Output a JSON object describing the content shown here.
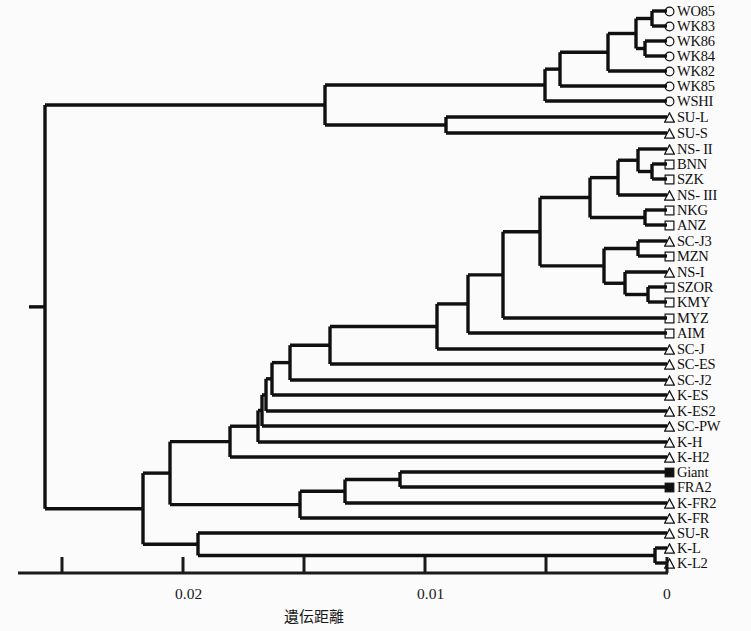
{
  "figure": {
    "type": "dendrogram",
    "axis": {
      "title": "遺伝距離",
      "ticks": [
        {
          "label": "",
          "value": 0.025,
          "x": 62
        },
        {
          "label": "0.02",
          "value": 0.02,
          "x": 183
        },
        {
          "label": "",
          "value": 0.015,
          "x": 304
        },
        {
          "label": "0.01",
          "value": 0.01,
          "x": 425
        },
        {
          "label": "",
          "value": 0.005,
          "x": 546
        },
        {
          "label": "0",
          "value": 0,
          "x": 667
        }
      ],
      "direction": "right-to-left",
      "min": 0,
      "max": 0.025
    },
    "colors": {
      "line": "#101010",
      "background": "#fbfbfb",
      "text": "#101010"
    },
    "marker_legend": {
      "circle": "open-circle",
      "triangle": "open-triangle",
      "square": "open-square",
      "filled_square": "filled-square"
    },
    "tips": [
      {
        "label": "WO85",
        "marker": "circle",
        "y": 11
      },
      {
        "label": "WK83",
        "marker": "circle",
        "y": 26
      },
      {
        "label": "WK86",
        "marker": "circle",
        "y": 41
      },
      {
        "label": "WK84",
        "marker": "circle",
        "y": 56
      },
      {
        "label": "WK82",
        "marker": "circle",
        "y": 71
      },
      {
        "label": "WK85",
        "marker": "circle",
        "y": 86
      },
      {
        "label": "WSHI",
        "marker": "circle",
        "y": 101
      },
      {
        "label": "SU-L",
        "marker": "triangle",
        "y": 117
      },
      {
        "label": "SU-S",
        "marker": "triangle",
        "y": 133
      },
      {
        "label": "NS- II",
        "marker": "triangle",
        "y": 149
      },
      {
        "label": "BNN",
        "marker": "square",
        "y": 164
      },
      {
        "label": "SZK",
        "marker": "square",
        "y": 179
      },
      {
        "label": "NS- III",
        "marker": "triangle",
        "y": 195
      },
      {
        "label": "NKG",
        "marker": "square",
        "y": 210
      },
      {
        "label": "ANZ",
        "marker": "square",
        "y": 225
      },
      {
        "label": "SC-J3",
        "marker": "triangle",
        "y": 241
      },
      {
        "label": "MZN",
        "marker": "square",
        "y": 256
      },
      {
        "label": "NS-I",
        "marker": "triangle",
        "y": 272
      },
      {
        "label": "SZOR",
        "marker": "square",
        "y": 287
      },
      {
        "label": "KMY",
        "marker": "square",
        "y": 302
      },
      {
        "label": "MYZ",
        "marker": "square",
        "y": 318
      },
      {
        "label": "AIM",
        "marker": "square",
        "y": 333
      },
      {
        "label": "SC-J",
        "marker": "triangle",
        "y": 349
      },
      {
        "label": "SC-ES",
        "marker": "triangle",
        "y": 364
      },
      {
        "label": "SC-J2",
        "marker": "triangle",
        "y": 380
      },
      {
        "label": "K-ES",
        "marker": "triangle",
        "y": 395
      },
      {
        "label": "K-ES2",
        "marker": "triangle",
        "y": 411
      },
      {
        "label": "SC-PW",
        "marker": "triangle",
        "y": 426
      },
      {
        "label": "K-H",
        "marker": "triangle",
        "y": 442
      },
      {
        "label": "K-H2",
        "marker": "triangle",
        "y": 457
      },
      {
        "label": "Giant",
        "marker": "filled_square",
        "y": 472
      },
      {
        "label": "FRA2",
        "marker": "filled_square",
        "y": 487
      },
      {
        "label": "K-FR2",
        "marker": "triangle",
        "y": 503
      },
      {
        "label": "K-FR",
        "marker": "triangle",
        "y": 518
      },
      {
        "label": "SU-R",
        "marker": "triangle",
        "y": 533
      },
      {
        "label": "K-L",
        "marker": "triangle",
        "y": 548
      },
      {
        "label": "K-L2",
        "marker": "triangle",
        "y": 563
      }
    ],
    "nodes": [
      {
        "name": "root",
        "x": 45,
        "y1": 58,
        "y2": 457
      },
      {
        "name": "n-top",
        "x": 325,
        "y1": 43,
        "y2": 125
      },
      {
        "name": "n-wk-all",
        "x": 560,
        "y1": 28,
        "y2": 101
      },
      {
        "name": "n-wk-a",
        "x": 608,
        "y1": 18,
        "y2": 71
      },
      {
        "name": "n-wk-b",
        "x": 636,
        "y1": 11,
        "y2": 33
      },
      {
        "name": "n-wk-c",
        "x": 652,
        "y1": 4,
        "y2": 26
      },
      {
        "name": "n-wk-d",
        "x": 645,
        "y1": 41,
        "y2": 56
      },
      {
        "name": "n-su",
        "x": 446,
        "y1": 117,
        "y2": 133
      },
      {
        "name": "n-big",
        "x": 143,
        "y1": 390,
        "y2": 524
      },
      {
        "name": "n-mid",
        "x": 258,
        "y1": 330,
        "y2": 457
      },
      {
        "name": "n-mid2",
        "x": 290,
        "y1": 295,
        "y2": 380
      },
      {
        "name": "n-mid3",
        "x": 330,
        "y1": 250,
        "y2": 364
      },
      {
        "name": "n-mid4",
        "x": 437,
        "y1": 205,
        "y2": 349
      },
      {
        "name": "n-core",
        "x": 468,
        "y1": 175,
        "y2": 318
      },
      {
        "name": "n-core2",
        "x": 503,
        "y1": 160,
        "y2": 302
      },
      {
        "name": "n-core3",
        "x": 540,
        "y1": 150,
        "y2": 256
      },
      {
        "name": "n-upper",
        "x": 580,
        "y1": 142,
        "y2": 210
      },
      {
        "name": "n-upper2",
        "x": 615,
        "y1": 138,
        "y2": 195
      },
      {
        "name": "n-upper3",
        "x": 638,
        "y1": 149,
        "y2": 171
      },
      {
        "name": "n-upper4",
        "x": 652,
        "y1": 164,
        "y2": 179
      },
      {
        "name": "n-upper5",
        "x": 645,
        "y1": 203,
        "y2": 225
      },
      {
        "name": "n-lower",
        "x": 602,
        "y1": 237,
        "y2": 280
      },
      {
        "name": "n-lower2",
        "x": 638,
        "y1": 241,
        "y2": 256
      },
      {
        "name": "n-lower3",
        "x": 625,
        "y1": 272,
        "y2": 295
      },
      {
        "name": "n-lower4",
        "x": 648,
        "y1": 287,
        "y2": 302
      },
      {
        "name": "n-giant",
        "x": 400,
        "y1": 472,
        "y2": 487
      },
      {
        "name": "n-fra",
        "x": 345,
        "y1": 480,
        "y2": 503
      },
      {
        "name": "n-bot",
        "x": 198,
        "y1": 518,
        "y2": 556
      },
      {
        "name": "n-kl",
        "x": 655,
        "y1": 548,
        "y2": 563
      }
    ]
  }
}
